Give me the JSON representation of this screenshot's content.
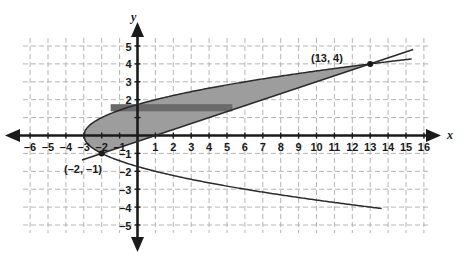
{
  "chart_data": {
    "type": "line",
    "title": "",
    "subtitle": "",
    "xlabel": "x",
    "ylabel": "y",
    "xlim": [
      -7,
      18
    ],
    "ylim": [
      -6,
      6
    ],
    "grid": true,
    "grid_style": "dashed",
    "legend": "none",
    "x_ticks": [
      -6,
      -5,
      -4,
      -3,
      -2,
      -1,
      1,
      2,
      3,
      4,
      5,
      6,
      7,
      8,
      9,
      10,
      11,
      12,
      13,
      14,
      15,
      16,
      17
    ],
    "y_ticks": [
      5,
      4,
      3,
      2,
      1,
      -1,
      -2,
      -3,
      -4,
      -5
    ],
    "x_tick_labels": [
      "–6",
      "–5",
      "–4",
      "–3",
      "–2",
      "–1",
      "1",
      "2",
      "3",
      "4",
      "5",
      "6",
      "7",
      "8",
      "9",
      "10",
      "11",
      "12",
      "13",
      "14",
      "15",
      "16",
      "17"
    ],
    "y_tick_labels": [
      "5",
      "4",
      "3",
      "2",
      "1",
      "–1",
      "–2",
      "–3",
      "–4",
      "–5"
    ],
    "y_tick_labels_shown": [
      "5",
      "4",
      "3",
      "2",
      "–1",
      "–2",
      "–3",
      "–4",
      "–5"
    ],
    "series": [
      {
        "name": "parabola-upper-branch",
        "type": "curve",
        "equation": "y = sqrt(x + 3)",
        "points": [
          {
            "x": -3,
            "y": 0
          },
          {
            "x": -2,
            "y": 1
          },
          {
            "x": -1,
            "y": 1.41
          },
          {
            "x": 0,
            "y": 1.73
          },
          {
            "x": 1,
            "y": 2
          },
          {
            "x": 5,
            "y": 2.83
          },
          {
            "x": 9,
            "y": 3.46
          },
          {
            "x": 13,
            "y": 4
          },
          {
            "x": 15.3,
            "y": 4.28
          }
        ]
      },
      {
        "name": "parabola-lower-branch",
        "type": "curve",
        "equation": "y = -sqrt(x + 3)",
        "points": [
          {
            "x": -3,
            "y": 0
          },
          {
            "x": -2,
            "y": -1
          },
          {
            "x": -1,
            "y": -1.41
          },
          {
            "x": 0,
            "y": -1.73
          },
          {
            "x": 1,
            "y": -2
          },
          {
            "x": 5,
            "y": -2.83
          },
          {
            "x": 9,
            "y": -3.46
          },
          {
            "x": 13,
            "y": -4
          },
          {
            "x": 13.6,
            "y": -4.07
          }
        ]
      },
      {
        "name": "straight-line",
        "type": "line",
        "equation": "y = x/3 - 1/3",
        "points": [
          {
            "x": -2,
            "y": -1
          },
          {
            "x": 13,
            "y": 4
          },
          {
            "x": 15.4,
            "y": 4.8
          }
        ]
      }
    ],
    "shaded_region": {
      "name": "region-between-line-and-parabola",
      "fill_color": "#9d9d9d",
      "description": "Region bounded above by the parabola upper branch and below by the straight line, from the vertex at (-3, 0) to the intersection at (13, 4)"
    },
    "dark_band": {
      "name": "horizontal-dark-band",
      "fill_color": "#6a6a6a",
      "y_top": 1.75,
      "y_bottom": 1.35,
      "x_start": -1.5,
      "x_end": 5.3
    },
    "marked_points": [
      {
        "name": "point-13-4",
        "x": 13,
        "y": 4,
        "label": "(13, 4)"
      },
      {
        "name": "point-neg2-neg1",
        "x": -2,
        "y": -1,
        "label": "(–2, –1)"
      }
    ],
    "annotations": [
      {
        "name": "label-13-4",
        "text": "(13, 4)",
        "x": 13,
        "y": 4.85
      },
      {
        "name": "label-neg2-neg1",
        "text": "(–2, –1)",
        "x": -3.6,
        "y": -2.1
      }
    ],
    "colors": {
      "axis": "#1a1a1a",
      "grid": "#b4b4b4",
      "curve": "#2a2a2a",
      "shade": "#9d9d9d",
      "shade_dark": "#6a6a6a",
      "background": "#ffffff"
    }
  }
}
